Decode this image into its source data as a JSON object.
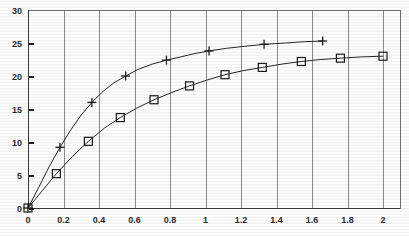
{
  "chart_data": {
    "type": "line",
    "title": "",
    "subtitle": "",
    "xlabel": "",
    "ylabel": "",
    "xlim": [
      0,
      2
    ],
    "ylim": [
      0,
      30
    ],
    "grid": "vertical-only",
    "legend_position": "none",
    "x_ticks": [
      0,
      0.2,
      0.4,
      0.6,
      0.8,
      1,
      1.2,
      1.4,
      1.6,
      1.8,
      2
    ],
    "x_tick_labels": [
      "0",
      "0.2",
      "0.4",
      "0.6",
      "0.8",
      "1",
      "1.2",
      "1.4",
      "1.6",
      "1.8",
      "2"
    ],
    "y_ticks": [
      0,
      5,
      10,
      15,
      20,
      25,
      30
    ],
    "y_tick_labels": [
      "0",
      "5",
      "10",
      "15",
      "20",
      "25",
      "30"
    ],
    "series": [
      {
        "name": "series-plus",
        "marker": "plus",
        "color": "#1a1a1a",
        "x": [
          0,
          0.06,
          0.12,
          0.18,
          0.24,
          0.3,
          0.36,
          0.42,
          0.48,
          0.55,
          0.62,
          0.7,
          0.78,
          0.86,
          0.94,
          1.02,
          1.12,
          1.22,
          1.33,
          1.45,
          1.56,
          1.66
        ],
        "y": [
          0,
          3.1,
          6.3,
          9.2,
          11.8,
          14.1,
          16.0,
          17.6,
          18.9,
          20.0,
          21.0,
          21.8,
          22.4,
          22.9,
          23.4,
          23.8,
          24.2,
          24.5,
          24.8,
          25.0,
          25.2,
          25.3
        ],
        "marked_x": [
          0,
          0.18,
          0.36,
          0.55,
          0.78,
          1.02,
          1.33,
          1.66
        ],
        "marked_y": [
          0,
          9.2,
          16.0,
          20.0,
          22.4,
          23.8,
          24.8,
          25.3
        ]
      },
      {
        "name": "series-square",
        "marker": "square",
        "color": "#1a1a1a",
        "x": [
          0,
          0.08,
          0.16,
          0.25,
          0.34,
          0.43,
          0.52,
          0.61,
          0.71,
          0.81,
          0.91,
          1.01,
          1.11,
          1.21,
          1.32,
          1.43,
          1.54,
          1.65,
          1.76,
          1.88,
          2.0
        ],
        "y": [
          0,
          2.6,
          5.2,
          7.8,
          10.1,
          12.1,
          13.7,
          15.1,
          16.4,
          17.5,
          18.5,
          19.4,
          20.2,
          20.8,
          21.3,
          21.8,
          22.2,
          22.5,
          22.7,
          22.9,
          23.0
        ],
        "marked_x": [
          0,
          0.16,
          0.34,
          0.52,
          0.71,
          0.91,
          1.11,
          1.32,
          1.54,
          1.76,
          2.0
        ],
        "marked_y": [
          0,
          5.2,
          10.1,
          13.7,
          16.4,
          18.5,
          20.2,
          21.3,
          22.2,
          22.7,
          23.0
        ]
      }
    ]
  },
  "plot_geometry": {
    "left": 28,
    "right": 383,
    "top": 10,
    "bottom": 208,
    "frame_right": 400
  }
}
